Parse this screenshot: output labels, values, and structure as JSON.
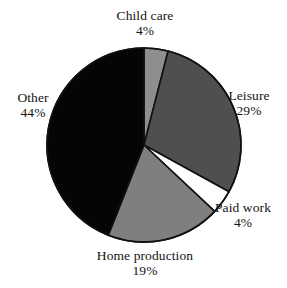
{
  "chart_data": {
    "type": "pie",
    "title": "",
    "subtitle": "",
    "xlabel": "",
    "ylabel": "",
    "legend_position": "none",
    "grid": false,
    "start_angle_deg": 0,
    "direction": "clockwise",
    "value_unit": "%",
    "categories": [
      "Child care",
      "Leisure",
      "Paid work",
      "Home production",
      "Other"
    ],
    "values": [
      4,
      29,
      4,
      19,
      44
    ],
    "labels": [
      "4%",
      "29%",
      "4%",
      "19%",
      "44%"
    ],
    "colors": [
      "#8e8e8e",
      "#4f4f4f",
      "#ffffff",
      "#7f7f7f",
      "#050505"
    ],
    "slices": [
      {
        "name": "Child care",
        "value": 4,
        "label": "4%",
        "color": "#8e8e8e",
        "exploded": false
      },
      {
        "name": "Leisure",
        "value": 29,
        "label": "29%",
        "color": "#4f4f4f",
        "exploded": false
      },
      {
        "name": "Paid work",
        "value": 4,
        "label": "4%",
        "color": "#ffffff",
        "exploded": false
      },
      {
        "name": "Home production",
        "value": 19,
        "label": "19%",
        "color": "#7f7f7f",
        "exploded": false
      },
      {
        "name": "Other",
        "value": 44,
        "label": "44%",
        "color": "#050505",
        "exploded": false
      }
    ]
  },
  "figure": {
    "background": "#ffffff",
    "outline_color": "#111111",
    "center_x": 144,
    "center_y": 145,
    "radius": 97
  }
}
